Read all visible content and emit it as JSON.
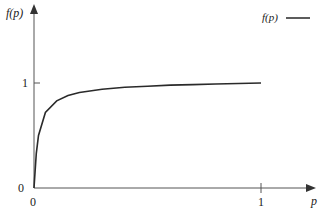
{
  "chart_data": {
    "type": "line",
    "title": "",
    "xlabel": "p",
    "ylabel": "f(p)",
    "xlim": [
      0,
      1.08
    ],
    "ylim": [
      0,
      1.25
    ],
    "x_ticks": [
      "0",
      "1"
    ],
    "y_ticks": [
      "0",
      "1"
    ],
    "grid": false,
    "legend_position": "top-right",
    "series": [
      {
        "name": "f(p)",
        "color": "#2a2a2a",
        "x": [
          0,
          0.01,
          0.02,
          0.05,
          0.1,
          0.15,
          0.2,
          0.3,
          0.4,
          0.5,
          0.6,
          0.7,
          0.8,
          0.9,
          1.0
        ],
        "values": [
          0,
          0.33,
          0.5,
          0.72,
          0.83,
          0.88,
          0.91,
          0.94,
          0.96,
          0.97,
          0.98,
          0.985,
          0.99,
          0.995,
          1.0
        ]
      }
    ]
  },
  "labels": {
    "y_axis": "f(p)",
    "x_axis": "p",
    "y_tick_one": "1",
    "y_tick_zero": "0",
    "x_tick_zero": "0",
    "x_tick_one": "1",
    "legend": "f(p)"
  }
}
